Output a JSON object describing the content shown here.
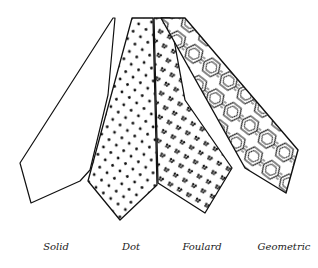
{
  "illustration": {
    "subject": "Necktie patterns",
    "ties": [
      {
        "id": "solid",
        "label": "Solid",
        "x": 56
      },
      {
        "id": "dot",
        "label": "Dot",
        "x": 131
      },
      {
        "id": "foulard",
        "label": "Foulard",
        "x": 202
      },
      {
        "id": "geometric",
        "label": "Geometric",
        "x": 284
      }
    ]
  }
}
